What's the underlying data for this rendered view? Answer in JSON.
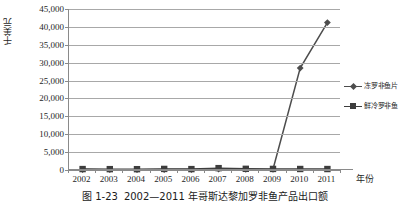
{
  "chart_data": {
    "type": "line",
    "title": "",
    "xlabel": "年份",
    "ylabel": "千美元",
    "categories": [
      "2002",
      "2003",
      "2004",
      "2005",
      "2006",
      "2007",
      "2008",
      "2009",
      "2010",
      "2011"
    ],
    "ylim": [
      0,
      45000
    ],
    "ytick_labels": [
      "0",
      "5,000",
      "10,000",
      "15,000",
      "20,000",
      "25,000",
      "30,000",
      "35,000",
      "40,000",
      "45,000"
    ],
    "ytick_values": [
      0,
      5000,
      10000,
      15000,
      20000,
      25000,
      30000,
      35000,
      40000,
      45000
    ],
    "grid": true,
    "legend_position": "right",
    "series": [
      {
        "name": "冻罗非鱼片",
        "marker": "diamond",
        "color": "#4d4d4d",
        "values": [
          120,
          100,
          90,
          110,
          130,
          260,
          150,
          200,
          28500,
          41200
        ]
      },
      {
        "name": "鲜冷罗非鱼",
        "marker": "square",
        "color": "#3d3d3d",
        "values": [
          260,
          240,
          230,
          300,
          250,
          520,
          330,
          300,
          280,
          270
        ]
      }
    ]
  },
  "caption": {
    "number": "图 1-23",
    "text": "2002—2011 年哥斯达黎加罗非鱼产品出口额"
  },
  "colors": {
    "grid": "#a8a8a8",
    "axis": "#8a8a8a",
    "series_primary": "#4d4d4d",
    "series_secondary": "#3d3d3d",
    "text": "#1f1f1f"
  }
}
